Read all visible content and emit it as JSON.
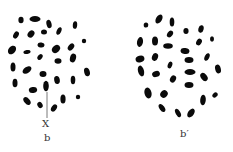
{
  "figure": {
    "panels": [
      {
        "id": "b",
        "label": "b",
        "marker_label": "X",
        "marker_line": {
          "x": 47,
          "y1": 92,
          "y2": 118
        },
        "chromosomes": [
          {
            "cx": 21,
            "cy": 20,
            "rx": 2.6,
            "ry": 3.2,
            "rot": 0
          },
          {
            "cx": 35,
            "cy": 19,
            "rx": 5.5,
            "ry": 3,
            "rot": 0
          },
          {
            "cx": 49,
            "cy": 24,
            "rx": 2.5,
            "ry": 4.2,
            "rot": -15
          },
          {
            "cx": 75,
            "cy": 25,
            "rx": 2.2,
            "ry": 3.8,
            "rot": 5
          },
          {
            "cx": 16,
            "cy": 35,
            "rx": 2.5,
            "ry": 3.8,
            "rot": 30
          },
          {
            "cx": 31,
            "cy": 34,
            "rx": 3,
            "ry": 4,
            "rot": 40
          },
          {
            "cx": 44,
            "cy": 32,
            "rx": 3,
            "ry": 2.5,
            "rot": 0
          },
          {
            "cx": 59,
            "cy": 31,
            "rx": 2.2,
            "ry": 4,
            "rot": 25
          },
          {
            "cx": 84,
            "cy": 41,
            "rx": 2.2,
            "ry": 2.2,
            "rot": 0
          },
          {
            "cx": 12,
            "cy": 50,
            "rx": 3.5,
            "ry": 4.8,
            "rot": 40
          },
          {
            "cx": 27,
            "cy": 52,
            "rx": 3.6,
            "ry": 2,
            "rot": -10
          },
          {
            "cx": 41,
            "cy": 45,
            "rx": 3.5,
            "ry": 2.5,
            "rot": 10
          },
          {
            "cx": 56,
            "cy": 49,
            "rx": 3.5,
            "ry": 4.5,
            "rot": 45
          },
          {
            "cx": 71,
            "cy": 47,
            "rx": 2.6,
            "ry": 4,
            "rot": 40
          },
          {
            "cx": 40,
            "cy": 57,
            "rx": 2.2,
            "ry": 3.2,
            "rot": 40
          },
          {
            "cx": 58,
            "cy": 61,
            "rx": 3.5,
            "ry": 2.8,
            "rot": 0
          },
          {
            "cx": 73,
            "cy": 58,
            "rx": 3,
            "ry": 4.5,
            "rot": 15
          },
          {
            "cx": 13,
            "cy": 67,
            "rx": 2.5,
            "ry": 4.5,
            "rot": 0
          },
          {
            "cx": 27,
            "cy": 70,
            "rx": 3,
            "ry": 5,
            "rot": 55
          },
          {
            "cx": 43,
            "cy": 74,
            "rx": 3.5,
            "ry": 3,
            "rot": 0
          },
          {
            "cx": 87,
            "cy": 72,
            "rx": 2.8,
            "ry": 4.3,
            "rot": -15
          },
          {
            "cx": 15,
            "cy": 83,
            "rx": 2.5,
            "ry": 4.3,
            "rot": 0
          },
          {
            "cx": 57,
            "cy": 80,
            "rx": 2.8,
            "ry": 4,
            "rot": -10
          },
          {
            "cx": 73,
            "cy": 80,
            "rx": 2.3,
            "ry": 4.2,
            "rot": 0
          },
          {
            "cx": 46,
            "cy": 86,
            "rx": 2.8,
            "ry": 5.2,
            "rot": 0
          },
          {
            "cx": 33,
            "cy": 90,
            "rx": 4.2,
            "ry": 3,
            "rot": -10
          },
          {
            "cx": 27,
            "cy": 101,
            "rx": 2.8,
            "ry": 4.5,
            "rot": -40
          },
          {
            "cx": 40,
            "cy": 105,
            "rx": 2.5,
            "ry": 3.2,
            "rot": -30
          },
          {
            "cx": 63,
            "cy": 99,
            "rx": 2.6,
            "ry": 4.5,
            "rot": 0
          },
          {
            "cx": 78,
            "cy": 97,
            "rx": 2.2,
            "ry": 2.2,
            "rot": 0
          },
          {
            "cx": 54,
            "cy": 108,
            "rx": 2.5,
            "ry": 4,
            "rot": 35
          }
        ]
      },
      {
        "id": "b-prime",
        "label": "b′",
        "chromosomes": [
          {
            "cx": 146,
            "cy": 25,
            "rx": 2.3,
            "ry": 2.6,
            "rot": 0
          },
          {
            "cx": 159,
            "cy": 19,
            "rx": 3,
            "ry": 5,
            "rot": 30
          },
          {
            "cx": 172,
            "cy": 22,
            "rx": 2.3,
            "ry": 4.5,
            "rot": 0
          },
          {
            "cx": 186,
            "cy": 31,
            "rx": 2.6,
            "ry": 3,
            "rot": 0
          },
          {
            "cx": 201,
            "cy": 29,
            "rx": 2.6,
            "ry": 3.8,
            "rot": 15
          },
          {
            "cx": 140,
            "cy": 42,
            "rx": 3,
            "ry": 5,
            "rot": 10
          },
          {
            "cx": 155,
            "cy": 41,
            "rx": 3,
            "ry": 4.5,
            "rot": 0
          },
          {
            "cx": 170,
            "cy": 34,
            "rx": 2.6,
            "ry": 3.8,
            "rot": 35
          },
          {
            "cx": 212,
            "cy": 39,
            "rx": 2,
            "ry": 2.7,
            "rot": 0
          },
          {
            "cx": 168,
            "cy": 46,
            "rx": 4.8,
            "ry": 2.7,
            "rot": 0
          },
          {
            "cx": 199,
            "cy": 42,
            "rx": 2.6,
            "ry": 3.6,
            "rot": 30
          },
          {
            "cx": 185,
            "cy": 51,
            "rx": 4.5,
            "ry": 3,
            "rot": 10
          },
          {
            "cx": 140,
            "cy": 59,
            "rx": 4.5,
            "ry": 3.3,
            "rot": -15
          },
          {
            "cx": 155,
            "cy": 57,
            "rx": 3,
            "ry": 4,
            "rot": 20
          },
          {
            "cx": 207,
            "cy": 57,
            "rx": 2.3,
            "ry": 4,
            "rot": 25
          },
          {
            "cx": 189,
            "cy": 60,
            "rx": 4.5,
            "ry": 3,
            "rot": 0
          },
          {
            "cx": 170,
            "cy": 65,
            "rx": 2.2,
            "ry": 3.5,
            "rot": 20
          },
          {
            "cx": 141,
            "cy": 71,
            "rx": 3,
            "ry": 5.5,
            "rot": -15
          },
          {
            "cx": 156,
            "cy": 74,
            "rx": 4,
            "ry": 3,
            "rot": -20
          },
          {
            "cx": 190,
            "cy": 72,
            "rx": 5.5,
            "ry": 3,
            "rot": 0
          },
          {
            "cx": 218,
            "cy": 69,
            "rx": 2.8,
            "ry": 4.5,
            "rot": -15
          },
          {
            "cx": 173,
            "cy": 79,
            "rx": 2.8,
            "ry": 3.8,
            "rot": 30
          },
          {
            "cx": 204,
            "cy": 77,
            "rx": 3,
            "ry": 4.5,
            "rot": -40
          },
          {
            "cx": 189,
            "cy": 85,
            "rx": 4.5,
            "ry": 3,
            "rot": 0
          },
          {
            "cx": 148,
            "cy": 93,
            "rx": 3.5,
            "ry": 5.5,
            "rot": -15
          },
          {
            "cx": 164,
            "cy": 94,
            "rx": 3.5,
            "ry": 4,
            "rot": 40
          },
          {
            "cx": 203,
            "cy": 100,
            "rx": 2.8,
            "ry": 5.3,
            "rot": 5
          },
          {
            "cx": 215,
            "cy": 95,
            "rx": 2.2,
            "ry": 3,
            "rot": 45
          },
          {
            "cx": 162,
            "cy": 108,
            "rx": 2.5,
            "ry": 4.5,
            "rot": -35
          },
          {
            "cx": 178,
            "cy": 113,
            "rx": 2.3,
            "ry": 4.5,
            "rot": -30
          },
          {
            "cx": 191,
            "cy": 113,
            "rx": 3,
            "ry": 5,
            "rot": 35
          }
        ]
      }
    ]
  }
}
